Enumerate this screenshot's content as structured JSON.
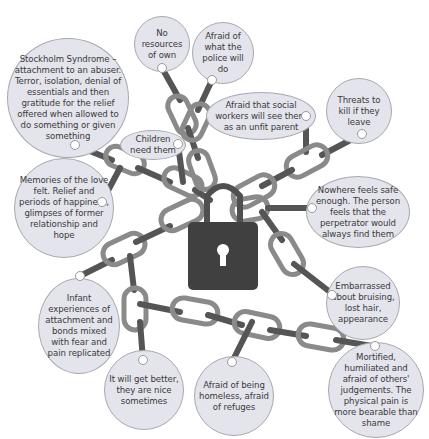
{
  "diagram": {
    "central_symbol": "padlock",
    "colors": {
      "bubble_fill": "#e4e4ec",
      "bubble_border": "#a8a8b0",
      "chain": "#6a6a6a",
      "padlock": "#404040",
      "text": "#3a3a3a"
    },
    "bubbles": [
      {
        "id": "stockholm",
        "text": "Stockholm Syndrome – attachment to an abuser. Terror, isolation, denial of essentials and then gratitude for the relief offered when allowed to do something or given something"
      },
      {
        "id": "no-resources",
        "text": "No resources of own"
      },
      {
        "id": "police",
        "text": "Afraid of what the police will do"
      },
      {
        "id": "social-workers",
        "text": "Afraid that social workers will see them as an unfit parent"
      },
      {
        "id": "threats",
        "text": "Threats to kill if they leave"
      },
      {
        "id": "children",
        "text": "Children need them"
      },
      {
        "id": "memories",
        "text": "Memories of the love felt. Relief and periods of happiness, glimpses of former relationship and hope"
      },
      {
        "id": "nowhere-safe",
        "text": "Nowhere feels safe enough. The person feels that the perpetrator would always find them"
      },
      {
        "id": "embarrassed",
        "text": "Embarrassed about bruising, lost hair, appearance"
      },
      {
        "id": "infant",
        "text": "Infant experiences of attachment and bonds mixed with fear and pain replicated"
      },
      {
        "id": "get-better",
        "text": "It will get better, they are nice sometimes"
      },
      {
        "id": "homeless",
        "text": "Afraid of being homeless, afraid of refuges"
      },
      {
        "id": "mortified",
        "text": "Mortified, humiliated and afraid of others' judgements. The physical pain is more bearable than shame"
      }
    ]
  }
}
